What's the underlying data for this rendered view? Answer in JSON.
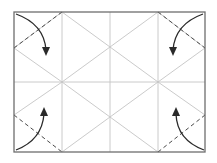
{
  "diagram": {
    "type": "origami-fold-instruction",
    "colors": {
      "background": "#ffffff",
      "frame": "#6e6e6e",
      "crease": "#c4c4c4",
      "fold_line": "#4a4a4a",
      "arrow": "#2a2a2a"
    },
    "frame": {
      "x1": 14,
      "y1": 12,
      "x2": 205,
      "y2": 152
    },
    "creases": [
      {
        "name": "vertical-left",
        "x1": 62,
        "y1": 12,
        "x2": 62,
        "y2": 152
      },
      {
        "name": "vertical-center",
        "x1": 110,
        "y1": 12,
        "x2": 110,
        "y2": 152
      },
      {
        "name": "vertical-right",
        "x1": 158,
        "y1": 12,
        "x2": 158,
        "y2": 152
      },
      {
        "name": "horizontal-center",
        "x1": 14,
        "y1": 82,
        "x2": 205,
        "y2": 82
      },
      {
        "name": "left-upper-diagonal",
        "x1": 14,
        "y1": 48,
        "x2": 62,
        "y2": 82
      },
      {
        "name": "left-lower-diagonal",
        "x1": 14,
        "y1": 115,
        "x2": 62,
        "y2": 82
      },
      {
        "name": "right-upper-diagonal",
        "x1": 205,
        "y1": 48,
        "x2": 158,
        "y2": 82
      },
      {
        "name": "right-lower-diagonal",
        "x1": 205,
        "y1": 115,
        "x2": 158,
        "y2": 82
      },
      {
        "name": "center-diag-a",
        "x1": 62,
        "y1": 12,
        "x2": 158,
        "y2": 82
      },
      {
        "name": "center-diag-b",
        "x1": 158,
        "y1": 12,
        "x2": 62,
        "y2": 82
      },
      {
        "name": "center-diag-c",
        "x1": 62,
        "y1": 82,
        "x2": 158,
        "y2": 152
      },
      {
        "name": "center-diag-d",
        "x1": 158,
        "y1": 82,
        "x2": 62,
        "y2": 152
      },
      {
        "name": "left-outer-diag-top",
        "x1": 14,
        "y1": 48,
        "x2": 62,
        "y2": 12
      },
      {
        "name": "right-outer-diag-top",
        "x1": 205,
        "y1": 48,
        "x2": 158,
        "y2": 12
      }
    ],
    "fold_lines": [
      {
        "name": "fold-top-left",
        "x1": 14,
        "y1": 48,
        "x2": 62,
        "y2": 12
      },
      {
        "name": "fold-top-right",
        "x1": 158,
        "y1": 12,
        "x2": 205,
        "y2": 48
      },
      {
        "name": "fold-bottom-left",
        "x1": 14,
        "y1": 115,
        "x2": 62,
        "y2": 152
      },
      {
        "name": "fold-bottom-right",
        "x1": 158,
        "y1": 152,
        "x2": 205,
        "y2": 115
      }
    ],
    "arrows": [
      {
        "name": "arrow-top-left",
        "path": "M16,14 Q44,24 46,50",
        "head": "46,56 42,47 50,47"
      },
      {
        "name": "arrow-top-right",
        "path": "M203,14 Q175,24 173,50",
        "head": "173,56 169,47 177,47"
      },
      {
        "name": "arrow-bottom-left",
        "path": "M16,150 Q42,140 44,114",
        "head": "44,107 40,116 48,116"
      },
      {
        "name": "arrow-bottom-right",
        "path": "M204,150 Q177,140 176,114",
        "head": "176,107 172,116 180,116"
      }
    ]
  }
}
